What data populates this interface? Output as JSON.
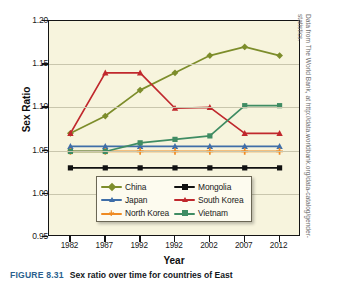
{
  "figure": {
    "number": "FIGURE 8.31",
    "caption": "Sex ratio over time for countries of East",
    "credit": "Data from The World Bank, at http://data.worldbank.org/data-catalog/gender-statistics."
  },
  "chart_data": {
    "type": "line",
    "title": "",
    "xlabel": "Year",
    "ylabel": "Sex Ratio",
    "categories": [
      "1982",
      "1987",
      "1992",
      "1992",
      "2002",
      "2007",
      "2012"
    ],
    "ylim": [
      0.95,
      1.2
    ],
    "yticks": [
      "0.95",
      "1.00",
      "1.05",
      "1.10",
      "1.15",
      "1.20"
    ],
    "ytick_values": [
      0.95,
      1.0,
      1.05,
      1.1,
      1.15,
      1.2
    ],
    "grid": true,
    "legend_position": "inside-bottom-center",
    "series": [
      {
        "name": "China",
        "color": "#7d8d2b",
        "marker": "diamond",
        "values": [
          1.07,
          1.09,
          1.12,
          1.14,
          1.16,
          1.17,
          1.16
        ]
      },
      {
        "name": "Japan",
        "color": "#3f6ea8",
        "marker": "triangle",
        "values": [
          1.055,
          1.055,
          1.055,
          1.055,
          1.055,
          1.055,
          1.055
        ]
      },
      {
        "name": "North Korea",
        "color": "#ef8b23",
        "marker": "plus",
        "values": [
          1.049,
          1.049,
          1.049,
          1.049,
          1.049,
          1.049,
          1.049
        ]
      },
      {
        "name": "Mongolia",
        "color": "#111111",
        "marker": "square",
        "values": [
          1.03,
          1.03,
          1.03,
          1.03,
          1.03,
          1.03,
          1.03
        ]
      },
      {
        "name": "South Korea",
        "color": "#c0282d",
        "marker": "triangle",
        "values": [
          1.07,
          1.14,
          1.14,
          1.099,
          1.1,
          1.07,
          1.07
        ]
      },
      {
        "name": "Vietnam",
        "color": "#3f8c63",
        "marker": "square",
        "values": [
          1.049,
          1.049,
          1.059,
          1.063,
          1.067,
          1.102,
          1.102
        ]
      }
    ]
  },
  "legend": {
    "items": [
      {
        "label": "China"
      },
      {
        "label": "Mongolia"
      },
      {
        "label": "Japan"
      },
      {
        "label": "South Korea"
      },
      {
        "label": "North Korea"
      },
      {
        "label": "Vietnam"
      }
    ]
  }
}
